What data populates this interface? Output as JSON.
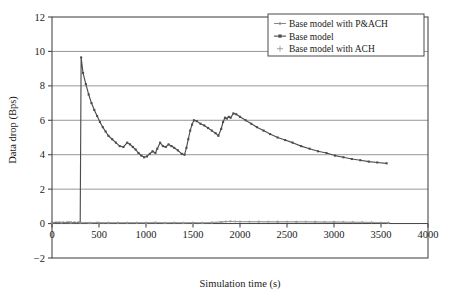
{
  "chart_data": {
    "type": "line",
    "title": "",
    "xlabel": "Simulation time (s)",
    "ylabel": "Data drop (Bps)",
    "xlim": [
      0,
      4000
    ],
    "ylim": [
      -2,
      12
    ],
    "xticks": [
      0,
      500,
      1000,
      1500,
      2000,
      2500,
      3000,
      3500,
      4000
    ],
    "yticks": [
      -2,
      0,
      2,
      4,
      6,
      8,
      10,
      12
    ],
    "grid": "horizontal",
    "legend_position": "top-right",
    "legend_entries": [
      "Base model with P&ACH",
      "Base model",
      "Base model with ACH"
    ],
    "series": [
      {
        "name": "Base model with P&ACH",
        "color": "#8a8a8a",
        "marker": "dot-dash",
        "x": [
          0,
          60,
          120,
          180,
          240,
          300,
          360,
          420,
          480,
          540,
          600,
          700,
          800,
          900,
          1000,
          1100,
          1200,
          1300,
          1400,
          1500,
          1600,
          1700,
          1800,
          1900,
          2000,
          2200,
          2400,
          2600,
          2800,
          3000,
          3200,
          3400,
          3580
        ],
        "y": [
          0.05,
          0.07,
          0.06,
          0.08,
          0.06,
          0.05,
          0.06,
          0.05,
          0.07,
          0.05,
          0.06,
          0.05,
          0.06,
          0.05,
          0.06,
          0.07,
          0.05,
          0.06,
          0.05,
          0.06,
          0.05,
          0.07,
          0.1,
          0.12,
          0.11,
          0.1,
          0.09,
          0.1,
          0.09,
          0.08,
          0.07,
          0.06,
          0.05
        ]
      },
      {
        "name": "Base model",
        "color": "#4d4d4d",
        "marker": "square",
        "x": [
          0,
          40,
          80,
          120,
          160,
          200,
          240,
          280,
          300,
          310,
          330,
          360,
          390,
          420,
          450,
          480,
          510,
          540,
          570,
          600,
          640,
          680,
          720,
          760,
          800,
          830,
          860,
          890,
          920,
          950,
          980,
          1010,
          1040,
          1070,
          1100,
          1120,
          1150,
          1180,
          1210,
          1240,
          1270,
          1300,
          1340,
          1380,
          1410,
          1430,
          1450,
          1470,
          1490,
          1510,
          1540,
          1580,
          1620,
          1660,
          1700,
          1740,
          1770,
          1800,
          1820,
          1840,
          1860,
          1880,
          1900,
          1930,
          1960,
          2000,
          2060,
          2120,
          2180,
          2250,
          2320,
          2400,
          2480,
          2560,
          2650,
          2740,
          2830,
          2920,
          3010,
          3100,
          3190,
          3280,
          3370,
          3460,
          3560
        ],
        "y": [
          0.05,
          0.05,
          0.05,
          0.05,
          0.05,
          0.05,
          0.05,
          0.05,
          0.05,
          9.65,
          8.75,
          8.1,
          7.5,
          7.0,
          6.6,
          6.25,
          5.9,
          5.6,
          5.35,
          5.1,
          4.9,
          4.7,
          4.5,
          4.45,
          4.7,
          4.6,
          4.45,
          4.3,
          4.1,
          3.95,
          3.85,
          3.9,
          4.05,
          4.2,
          4.1,
          4.35,
          4.7,
          4.5,
          4.45,
          4.6,
          4.5,
          4.4,
          4.25,
          4.05,
          4.0,
          4.4,
          4.9,
          5.4,
          5.75,
          6.0,
          5.95,
          5.8,
          5.7,
          5.55,
          5.4,
          5.25,
          5.1,
          5.5,
          5.9,
          6.15,
          6.1,
          6.2,
          6.15,
          6.4,
          6.35,
          6.2,
          6.0,
          5.8,
          5.6,
          5.4,
          5.2,
          5.0,
          4.85,
          4.7,
          4.5,
          4.35,
          4.2,
          4.1,
          3.95,
          3.85,
          3.75,
          3.68,
          3.6,
          3.55,
          3.5
        ]
      },
      {
        "name": "Base model with ACH",
        "color": "#9a9a9a",
        "marker": "plus",
        "x": [
          0,
          100,
          200,
          300,
          400,
          500,
          600,
          700,
          800,
          900,
          1000,
          1100,
          1200,
          1300,
          1400,
          1500,
          1600,
          1700,
          1800,
          1850,
          1900,
          1950,
          2000,
          2100,
          2200,
          2300,
          2400,
          2500,
          2600,
          2700,
          2800,
          2900,
          3000,
          3100,
          3200,
          3300,
          3400,
          3500,
          3580
        ],
        "y": [
          0.04,
          0.05,
          0.04,
          0.05,
          0.04,
          0.05,
          0.04,
          0.05,
          0.04,
          0.05,
          0.04,
          0.05,
          0.04,
          0.05,
          0.04,
          0.05,
          0.04,
          0.05,
          0.08,
          0.12,
          0.13,
          0.12,
          0.12,
          0.11,
          0.12,
          0.11,
          0.12,
          0.11,
          0.1,
          0.11,
          0.1,
          0.09,
          0.1,
          0.09,
          0.08,
          0.08,
          0.07,
          0.06,
          0.05
        ]
      }
    ]
  },
  "colors": {
    "frame": "#4a4a4a",
    "grid": "#8c8c8c",
    "text": "#1a1a1a",
    "background": "#ffffff"
  }
}
